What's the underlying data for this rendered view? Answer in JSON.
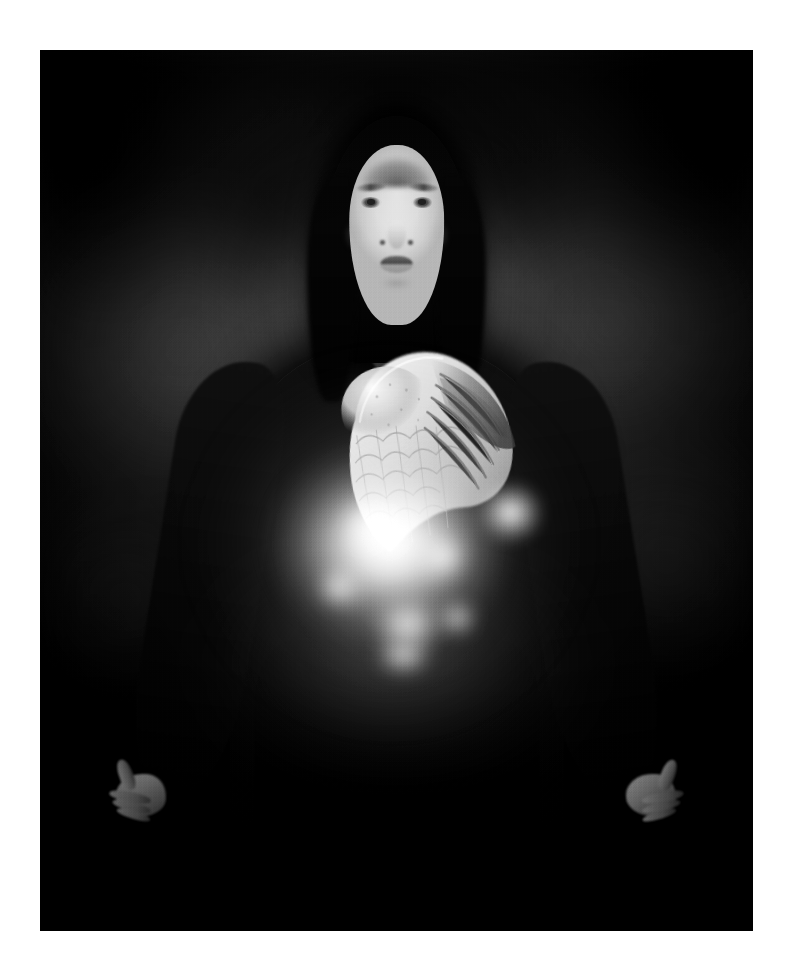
{
  "page": {
    "title": "Untitled photographic print",
    "background_color": "#ffffff",
    "canvas_width": 791,
    "canvas_height": 977
  },
  "print": {
    "medium": "black-and-white photograph",
    "border_color": "#ffffff",
    "plate_left": 40,
    "plate_top": 50,
    "plate_width": 713,
    "plate_height": 881,
    "orientation": "portrait",
    "tonality": "monochrome, low-key, high contrast"
  },
  "scene": {
    "subject_label": "hooded woman with glowing torso",
    "composition": "centered frontal half-length portrait",
    "lighting": "single soft frontal key light on the face, internal light source at the abdomen",
    "backdrop_label": "mottled dark studio backdrop"
  },
  "elements": {
    "backdrop": {
      "name": "dark mottled backdrop",
      "tone_hex": "#1d1d1d",
      "highlight_hex": "#3a3a3a",
      "shadow_hex": "#040404"
    },
    "halo": {
      "name": "soft luminous halo behind the head",
      "tone_hex": "#7a7a7a"
    },
    "hood": {
      "name": "black hood draped over head and shoulders",
      "tone_hex": "#0a0a0a"
    },
    "face": {
      "name": "pale expressionless face looking at the camera",
      "tone_hex": "#e6e6e6"
    },
    "eyes": {
      "name": "pair of open eyes with direct gaze",
      "tone_hex": "#3a3a3a"
    },
    "lips": {
      "name": "closed lips",
      "tone_hex": "#5a5a5a"
    },
    "neck": {
      "name": "exposed neck",
      "tone_hex": "#c4c4c4"
    },
    "robe": {
      "name": "long black robe with flared bell sleeves",
      "tone_hex": "#0c0c0c"
    },
    "torso": {
      "name": "bare torso visible through the open robe",
      "tone_hex": "#9e9e9e"
    },
    "wing": {
      "name": "feathered bird wing superimposed over the chest",
      "tone_hex": "#dcdcdc",
      "feather_rows": 7
    },
    "glow": {
      "name": "bright light emanating from the abdomen",
      "core_hex": "#ffffff",
      "halo_hex": "#d0d0d0"
    },
    "hand_left": {
      "name": "left hand open at the side, fingers relaxed",
      "tone_hex": "#a8a8a8"
    },
    "hand_right": {
      "name": "right hand open at the side, fingers relaxed",
      "tone_hex": "#9a9a9a"
    },
    "vignette": {
      "name": "darkened corners",
      "tone_hex": "#000000"
    },
    "grain": {
      "name": "film grain texture"
    }
  }
}
